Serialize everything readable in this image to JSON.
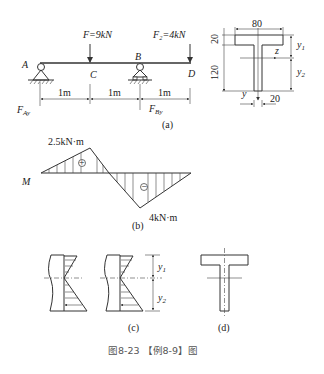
{
  "figure": {
    "caption": "图8-23 【例8-9】图",
    "beam": {
      "subfigure_label": "(a)",
      "point_labels": {
        "A": "A",
        "B": "B",
        "C": "C",
        "D": "D"
      },
      "loads": [
        {
          "label": "F=9kN",
          "at": "C"
        },
        {
          "label": "F₂=4kN",
          "at": "D"
        }
      ],
      "reactions": {
        "A": "F",
        "A_sub": "Ay",
        "B": "F",
        "B_sub": "By"
      },
      "spans": [
        "1m",
        "1m",
        "1m"
      ]
    },
    "section": {
      "width_label": "80",
      "flange_label": "20",
      "web_height_label": "120",
      "web_width_label": "20",
      "axis_z": "z",
      "axis_y": "y",
      "y1": "y",
      "y1_sub": "1",
      "y2": "y",
      "y2_sub": "2"
    },
    "moment": {
      "subfigure_label": "(b)",
      "axis_label": "M",
      "max_positive": "2.5kN·m",
      "max_negative": "4kN·m",
      "positive_sign": "+",
      "negative_sign": "−"
    },
    "stress": {
      "subfigure_label": "(c)",
      "y1": "y",
      "y1_sub": "1",
      "y2": "y",
      "y2_sub": "2"
    },
    "tsection": {
      "subfigure_label": "(d)"
    }
  }
}
